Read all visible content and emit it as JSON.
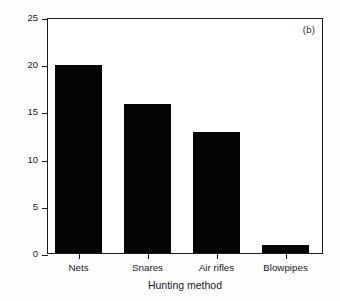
{
  "chart_data": {
    "type": "bar",
    "title": "",
    "panel_label": "(b)",
    "categories": [
      "Nets",
      "Snares",
      "Air rifles",
      "Blowpipes"
    ],
    "values": [
      19.9,
      15.8,
      12.8,
      0.85
    ],
    "xlabel": "Hunting method",
    "ylabel": "Number of individuals",
    "ylim": [
      0,
      25
    ],
    "yticks": [
      0,
      5,
      10,
      15,
      20,
      25
    ],
    "ytick_labels": [
      "0",
      "5",
      "10",
      "15",
      "20",
      "25"
    ],
    "grid": false,
    "legend": null,
    "bar_color": "#050505",
    "axis_color": "#1a1a1a",
    "background_color": "#ffffff"
  }
}
